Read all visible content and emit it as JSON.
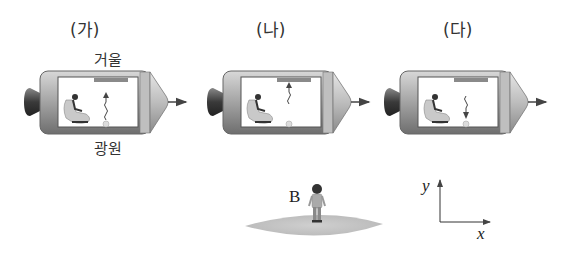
{
  "panels": [
    {
      "id": "ga",
      "label": "(가)",
      "observer": "A",
      "mirror_label": "거울",
      "light_label": "빛",
      "source_label": "광원",
      "light_direction": "up-from-source"
    },
    {
      "id": "na",
      "label": "(나)",
      "observer": "A",
      "light_direction": "up-arriving-at-mirror"
    },
    {
      "id": "da",
      "label": "(다)",
      "observer": "A",
      "light_direction": "down-returning-to-source"
    }
  ],
  "ground_observer": {
    "label": "B"
  },
  "axes": {
    "x_label": "x",
    "y_label": "y"
  },
  "motion": {
    "direction": "+x",
    "arrow": "right"
  },
  "colors": {
    "hull": "#9a9a9a",
    "hull_dark": "#5a5a5a",
    "window": "#ffffff",
    "mirror": "#888888",
    "ground": "#c8c8c8",
    "line": "#333333"
  }
}
